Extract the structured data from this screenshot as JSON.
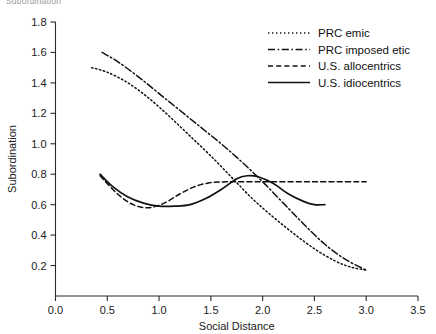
{
  "figure": {
    "title_clipped": "Subordination",
    "background": "#ffffff",
    "ink_color": "#111111"
  },
  "chart_data": {
    "type": "line",
    "title": "",
    "xlabel": "Social Distance",
    "ylabel": "Subordination",
    "xlim": [
      0.0,
      3.5
    ],
    "ylim": [
      0.0,
      1.8
    ],
    "xticks": [
      "0.0",
      "0.5",
      "1.0",
      "1.5",
      "2.0",
      "2.5",
      "3.0",
      "3.5"
    ],
    "xtick_values": [
      0.0,
      0.5,
      1.0,
      1.5,
      2.0,
      2.5,
      3.0,
      3.5
    ],
    "yticks": [
      "0.2",
      "0.4",
      "0.6",
      "0.8",
      "1.0",
      "1.2",
      "1.4",
      "1.6",
      "1.8"
    ],
    "ytick_values": [
      0.2,
      0.4,
      0.6,
      0.8,
      1.0,
      1.2,
      1.4,
      1.6,
      1.8
    ],
    "grid": false,
    "legend_position": "top-right",
    "series": [
      {
        "name": "PRC emic",
        "style": "dotted",
        "dasharray": "1.4,2.6",
        "width": 1.5,
        "x": [
          0.35,
          0.5,
          0.7,
          0.9,
          1.1,
          1.3,
          1.5,
          1.7,
          1.9,
          2.1,
          2.3,
          2.5,
          2.7,
          2.85,
          3.0
        ],
        "y": [
          1.5,
          1.47,
          1.4,
          1.3,
          1.18,
          1.05,
          0.92,
          0.78,
          0.64,
          0.52,
          0.41,
          0.31,
          0.23,
          0.19,
          0.17
        ]
      },
      {
        "name": "PRC imposed etic",
        "style": "dash-dot",
        "dasharray": "7,2.6,1.6,2.6",
        "width": 1.5,
        "x": [
          0.45,
          0.6,
          0.8,
          1.0,
          1.2,
          1.4,
          1.6,
          1.8,
          2.0,
          2.2,
          2.4,
          2.6,
          2.8,
          3.0
        ],
        "y": [
          1.6,
          1.54,
          1.44,
          1.33,
          1.22,
          1.11,
          1.0,
          0.88,
          0.75,
          0.61,
          0.47,
          0.34,
          0.24,
          0.17
        ]
      },
      {
        "name": "U.S. allocentrics",
        "style": "dashed",
        "dasharray": "5,3.2",
        "width": 1.5,
        "x": [
          0.43,
          0.6,
          0.75,
          0.9,
          1.05,
          1.2,
          1.35,
          1.5,
          1.65,
          1.8,
          2.0,
          2.3,
          2.6,
          3.0
        ],
        "y": [
          0.79,
          0.67,
          0.6,
          0.58,
          0.61,
          0.67,
          0.72,
          0.745,
          0.75,
          0.75,
          0.75,
          0.75,
          0.75,
          0.75
        ]
      },
      {
        "name": "U.S. idiocentrics",
        "style": "solid",
        "dasharray": "",
        "width": 1.7,
        "x": [
          0.43,
          0.55,
          0.7,
          0.85,
          1.0,
          1.15,
          1.3,
          1.45,
          1.6,
          1.75,
          1.85,
          1.95,
          2.1,
          2.25,
          2.4,
          2.5,
          2.6
        ],
        "y": [
          0.8,
          0.72,
          0.65,
          0.61,
          0.59,
          0.59,
          0.6,
          0.64,
          0.7,
          0.77,
          0.79,
          0.785,
          0.74,
          0.67,
          0.62,
          0.6,
          0.6
        ]
      }
    ]
  },
  "legend": {
    "items": [
      {
        "label": "PRC emic"
      },
      {
        "label": "PRC imposed etic"
      },
      {
        "label": "U.S. allocentrics"
      },
      {
        "label": "U.S. idiocentrics"
      }
    ]
  }
}
